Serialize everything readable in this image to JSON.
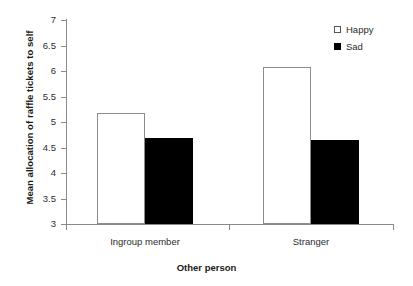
{
  "chart_data": {
    "type": "bar",
    "title": "",
    "xlabel": "Other person",
    "ylabel": "Mean allocation of raffle tickets to self",
    "categories": [
      "Ingroup member",
      "Stranger"
    ],
    "series": [
      {
        "name": "Happy",
        "values": [
          5.18,
          6.08
        ],
        "color": "#ffffff",
        "marker": "open-square"
      },
      {
        "name": "Sad",
        "values": [
          4.69,
          4.64
        ],
        "color": "#000000",
        "marker": "filled-square"
      }
    ],
    "ylim": [
      3,
      7
    ],
    "ytick_labels": [
      "7",
      "6.5",
      "6",
      "5.5",
      "5",
      "4.5",
      "4",
      "3.5",
      "3"
    ],
    "ytick_values": [
      7,
      6.5,
      6,
      5.5,
      5,
      4.5,
      4,
      3.5,
      3
    ],
    "grid": false,
    "legend_position": "top-right",
    "legend_entries": [
      "Happy",
      "Sad"
    ]
  }
}
